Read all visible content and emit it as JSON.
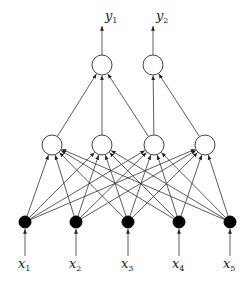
{
  "diagram": {
    "type": "feedforward-neural-network",
    "colors": {
      "edge": "#333333",
      "hidden_node_fill": "#ffffff",
      "input_node_fill": "#000000",
      "output_node_fill": "#ffffff"
    },
    "layers": {
      "input": {
        "style": "filled",
        "nodes": [
          {
            "id": "x1",
            "label": "x",
            "sub": "1"
          },
          {
            "id": "x2",
            "label": "x",
            "sub": "2"
          },
          {
            "id": "x3",
            "label": "x",
            "sub": "3"
          },
          {
            "id": "x4",
            "label": "x",
            "sub": "4"
          },
          {
            "id": "x5",
            "label": "x",
            "sub": "5"
          }
        ]
      },
      "hidden": {
        "style": "hollow",
        "nodes": [
          {
            "id": "h1"
          },
          {
            "id": "h2"
          },
          {
            "id": "h3"
          },
          {
            "id": "h4"
          }
        ]
      },
      "output": {
        "style": "hollow",
        "nodes": [
          {
            "id": "y1",
            "label": "y",
            "sub": "1"
          },
          {
            "id": "y2",
            "label": "y",
            "sub": "2"
          }
        ]
      }
    },
    "edges": [
      [
        "x1",
        "h1"
      ],
      [
        "x1",
        "h2"
      ],
      [
        "x1",
        "h3"
      ],
      [
        "x1",
        "h4"
      ],
      [
        "x2",
        "h1"
      ],
      [
        "x2",
        "h2"
      ],
      [
        "x2",
        "h3"
      ],
      [
        "x2",
        "h4"
      ],
      [
        "x3",
        "h1"
      ],
      [
        "x3",
        "h2"
      ],
      [
        "x3",
        "h3"
      ],
      [
        "x3",
        "h4"
      ],
      [
        "x4",
        "h1"
      ],
      [
        "x4",
        "h2"
      ],
      [
        "x4",
        "h3"
      ],
      [
        "x4",
        "h4"
      ],
      [
        "x5",
        "h1"
      ],
      [
        "x5",
        "h2"
      ],
      [
        "x5",
        "h3"
      ],
      [
        "x5",
        "h4"
      ],
      [
        "h1",
        "y1"
      ],
      [
        "h2",
        "y1"
      ],
      [
        "h3",
        "y1"
      ],
      [
        "h3",
        "y2"
      ],
      [
        "h4",
        "y2"
      ]
    ],
    "input_arrows": [
      "x1",
      "x2",
      "x3",
      "x4",
      "x5"
    ],
    "output_arrows": [
      "y1",
      "y2"
    ]
  }
}
